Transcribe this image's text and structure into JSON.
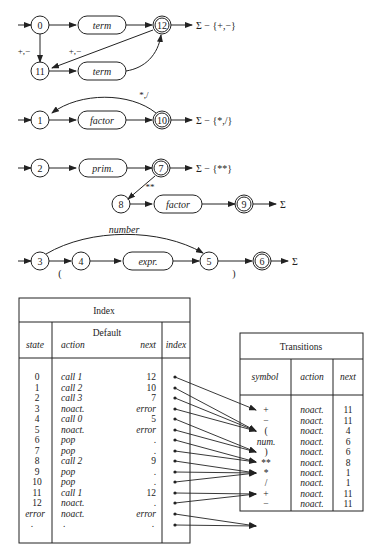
{
  "diagram": {
    "machine_expr": {
      "states": [
        "0",
        "11",
        "12"
      ],
      "boxes": [
        "term",
        "term"
      ],
      "labels": {
        "down": "+,−",
        "back": "+,−",
        "exit": "Σ − {+,−}"
      }
    },
    "machine_term": {
      "states": [
        "1",
        "10"
      ],
      "boxes": [
        "factor"
      ],
      "labels": {
        "back": "*,/",
        "exit": "Σ − {*,/}"
      }
    },
    "machine_factor": {
      "states": [
        "2",
        "7",
        "8",
        "9"
      ],
      "boxes": [
        "prim.",
        "factor"
      ],
      "labels": {
        "power": "**",
        "exit7": "Σ − {**}",
        "exit9": "Σ"
      }
    },
    "machine_prim": {
      "states": [
        "3",
        "4",
        "5",
        "6"
      ],
      "boxes": [
        "expr."
      ],
      "labels": {
        "number": "number",
        "lparen": "(",
        "rparen": ")",
        "exit": "Σ"
      }
    }
  },
  "index_table": {
    "title": "Index",
    "group_header": "Default",
    "columns": [
      "state",
      "action",
      "next",
      "index"
    ],
    "rows": [
      {
        "state": "0",
        "action": "call 1",
        "next": "12"
      },
      {
        "state": "1",
        "action": "call 2",
        "next": "10"
      },
      {
        "state": "2",
        "action": "call 3",
        "next": "7"
      },
      {
        "state": "3",
        "action": "noact.",
        "next": "error"
      },
      {
        "state": "4",
        "action": "call 0",
        "next": "5"
      },
      {
        "state": "5",
        "action": "noact.",
        "next": "error"
      },
      {
        "state": "6",
        "action": "pop",
        "next": "."
      },
      {
        "state": "7",
        "action": "pop",
        "next": "."
      },
      {
        "state": "8",
        "action": "call 2",
        "next": "9"
      },
      {
        "state": "9",
        "action": "pop",
        "next": "."
      },
      {
        "state": "10",
        "action": "pop",
        "next": "."
      },
      {
        "state": "11",
        "action": "call 1",
        "next": "12"
      },
      {
        "state": "12",
        "action": "noact.",
        "next": "."
      },
      {
        "state": "error",
        "action": "noact.",
        "next": "error"
      },
      {
        "state": ".",
        "action": ".",
        "next": "."
      }
    ]
  },
  "transitions_table": {
    "title": "Transitions",
    "columns": [
      "symbol",
      "action",
      "next"
    ],
    "rows": [
      {
        "symbol": "+",
        "action": "noact.",
        "next": "11"
      },
      {
        "symbol": "−",
        "action": "noact.",
        "next": "11"
      },
      {
        "symbol": "(",
        "action": "noact.",
        "next": "4"
      },
      {
        "symbol": "num.",
        "action": "noact.",
        "next": "6"
      },
      {
        "symbol": ")",
        "action": "noact.",
        "next": "6"
      },
      {
        "symbol": "**",
        "action": "noact.",
        "next": "8"
      },
      {
        "symbol": "*",
        "action": "noact.",
        "next": "1"
      },
      {
        "symbol": "/",
        "action": "noact.",
        "next": "1"
      },
      {
        "symbol": "+",
        "action": "noact.",
        "next": "11"
      },
      {
        "symbol": "−",
        "action": "noact.",
        "next": "11"
      }
    ]
  }
}
